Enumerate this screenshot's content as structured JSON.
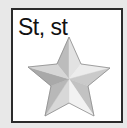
{
  "card": {
    "label": "St, st",
    "icon": "star-icon"
  },
  "colors": {
    "background": "#e8e8e8",
    "card": "#ffffff",
    "border": "#2b2b2b",
    "text": "#111111",
    "outline": "#8a8a8a"
  },
  "star": {
    "style": "beveled-silver",
    "facets": [
      {
        "name": "top-left",
        "color": "#bcbcbc"
      },
      {
        "name": "top-right",
        "color": "#e2e2e2"
      },
      {
        "name": "right-upper",
        "color": "#ececec"
      },
      {
        "name": "right-lower",
        "color": "#cacaca"
      },
      {
        "name": "bottom-right-right",
        "color": "#c2c2c2"
      },
      {
        "name": "bottom-right-left",
        "color": "#f2f2f2"
      },
      {
        "name": "bottom-left-right",
        "color": "#d8d8d8"
      },
      {
        "name": "bottom-left-left",
        "color": "#b8b8b8"
      },
      {
        "name": "left-lower",
        "color": "#a9a9a9"
      },
      {
        "name": "left-upper",
        "color": "#d6d6d6"
      }
    ]
  }
}
